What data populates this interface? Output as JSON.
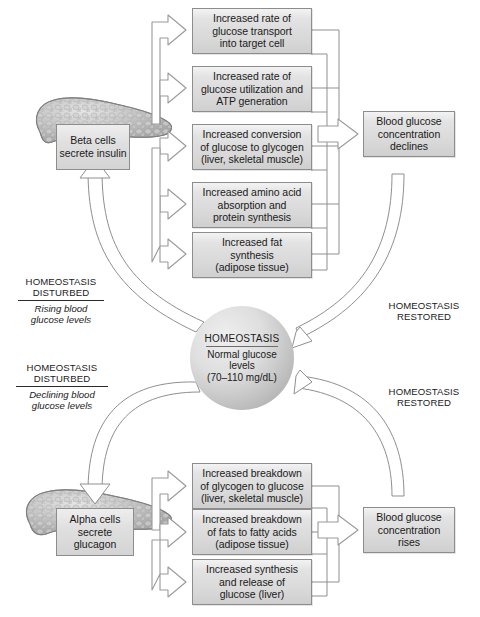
{
  "diagram": {
    "colors": {
      "box_border": "#8d8d8d",
      "box_fill": "#dddddd",
      "arrow_stroke": "#9a9a9a",
      "line_stroke": "#8f8f8f",
      "organ_fill": "#b6b6b6",
      "text": "#1a1a1a"
    }
  },
  "top_pathway": {
    "source": {
      "label": "Beta cells\nsecrete\ninsulin",
      "organ": "pancreas-illustration"
    },
    "effects": [
      {
        "label": "Increased rate of\nglucose transport\ninto target cell"
      },
      {
        "label": "Increased rate of\nglucose utilization and\nATP generation"
      },
      {
        "label": "Increased conversion\nof glucose to glycogen\n(liver, skeletal muscle)"
      },
      {
        "label": "Increased amino acid\nabsorption and\nprotein synthesis"
      },
      {
        "label": "Increased fat\nsynthesis\n(adipose tissue)"
      }
    ],
    "outcome": {
      "label": "Blood glucose\nconcentration\ndeclines"
    },
    "stimulus_caption": {
      "status": "HOMEOSTASIS\nDISTURBED",
      "detail": "Rising blood\nglucose levels"
    },
    "return_caption": {
      "status": "HOMEOSTASIS\nRESTORED",
      "detail": ""
    }
  },
  "bottom_pathway": {
    "source": {
      "label": "Alpha cells\nsecrete\nglucagon",
      "organ": "pancreas-illustration"
    },
    "effects": [
      {
        "label": "Increased breakdown\nof glycogen to glucose\n(liver, skeletal muscle)"
      },
      {
        "label": "Increased breakdown\nof fats to fatty acids\n(adipose tissue)"
      },
      {
        "label": "Increased synthesis\nand release of\nglucose (liver)"
      }
    ],
    "outcome": {
      "label": "Blood glucose\nconcentration\nrises"
    },
    "stimulus_caption": {
      "status": "HOMEOSTASIS\nDISTURBED",
      "detail": "Declining blood\nglucose levels"
    },
    "return_caption": {
      "status": "HOMEOSTASIS\nRESTORED",
      "detail": ""
    }
  },
  "center": {
    "heading": "HOMEOSTASIS",
    "body": "Normal glucose\nlevels\n(70–110 mg/dL)"
  }
}
